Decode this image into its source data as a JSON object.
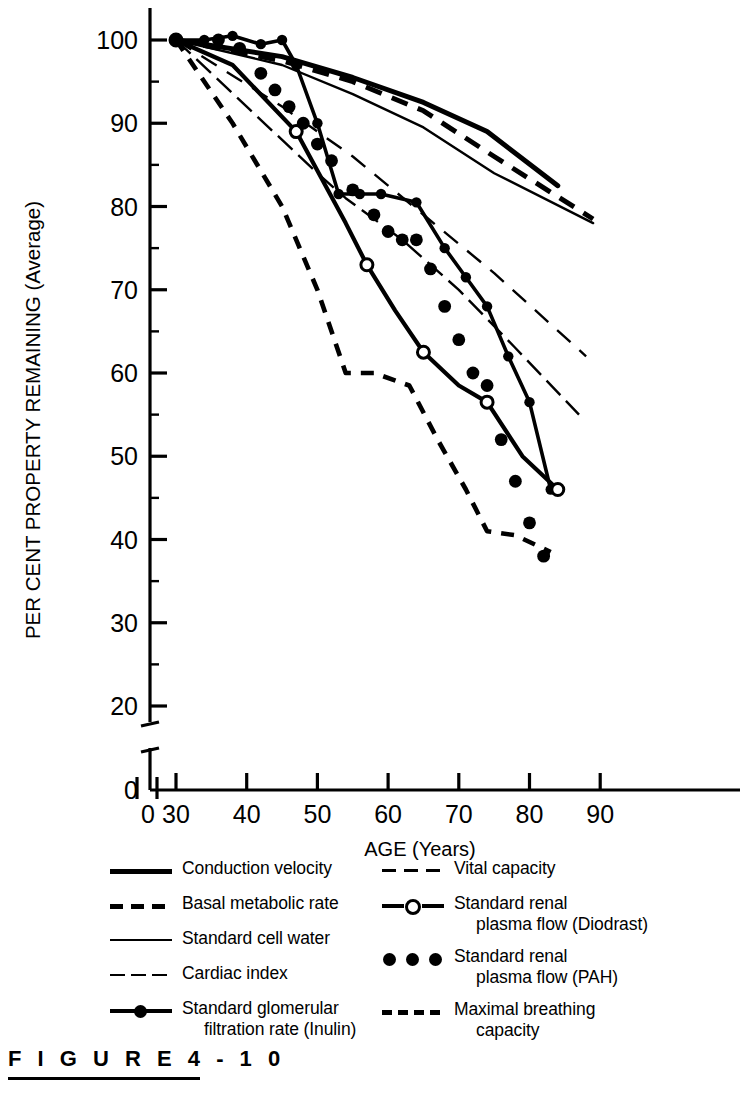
{
  "figure": {
    "caption": "F I G U R E   4 - 1 0",
    "number": "4-10"
  },
  "axes": {
    "x_label": "AGE (Years)",
    "y_label": "PER CENT PROPERTY REMAINING (Average)",
    "x_ticks": [
      "0",
      "30",
      "40",
      "50",
      "60",
      "70",
      "80",
      "90"
    ],
    "y_ticks": [
      "0",
      "20",
      "30",
      "40",
      "50",
      "60",
      "70",
      "80",
      "90",
      "100"
    ],
    "x_break": true,
    "y_break": true
  },
  "legend": {
    "left": [
      {
        "label": "Conduction velocity",
        "style": "solid-thick",
        "name": "conduction-velocity"
      },
      {
        "label": "Basal metabolic rate",
        "style": "dashed-thick",
        "name": "basal-metabolic-rate"
      },
      {
        "label": "Standard cell water",
        "style": "solid-thin",
        "name": "standard-cell-water"
      },
      {
        "label": "Cardiac index",
        "style": "dash-dot",
        "name": "cardiac-index"
      },
      {
        "label": "Standard glomerular",
        "label2": "filtration rate (Inulin)",
        "style": "solid-marker-filled",
        "name": "gfr-inulin"
      }
    ],
    "right": [
      {
        "label": "Vital capacity",
        "style": "dashed-thin",
        "name": "vital-capacity"
      },
      {
        "label": "Standard renal",
        "label2": "plasma flow (Diodrast)",
        "style": "solid-marker-open",
        "name": "srpf-diodrast"
      },
      {
        "label": "Standard renal",
        "label2": "plasma flow (PAH)",
        "style": "dotted-round",
        "name": "srpf-pah"
      },
      {
        "label": "Maximal breathing",
        "label2": "capacity",
        "style": "dashed-short",
        "name": "maximal-breathing-capacity"
      }
    ]
  },
  "chart_data": {
    "type": "line",
    "title": "",
    "xlabel": "AGE (Years)",
    "ylabel": "PER CENT PROPERTY REMAINING (Average)",
    "xlim": [
      28,
      92
    ],
    "ylim": [
      20,
      103
    ],
    "grid": false,
    "legend_position": "below",
    "series": [
      {
        "name": "Conduction velocity",
        "style": "solid-thick",
        "x": [
          30,
          45,
          55,
          65,
          74,
          84
        ],
        "y": [
          100,
          98,
          95.5,
          92.5,
          89,
          82.5
        ]
      },
      {
        "name": "Basal metabolic rate",
        "style": "dashed-thick",
        "x": [
          30,
          45,
          55,
          65,
          75,
          89
        ],
        "y": [
          100,
          97.5,
          95,
          91.5,
          86,
          78.5
        ]
      },
      {
        "name": "Standard cell water",
        "style": "solid-thin",
        "x": [
          30,
          45,
          55,
          65,
          75,
          89
        ],
        "y": [
          100,
          97,
          93.5,
          89.5,
          84,
          78
        ]
      },
      {
        "name": "Cardiac index",
        "style": "dash-dot",
        "x": [
          30,
          40,
          50,
          54,
          62,
          70,
          78,
          87
        ],
        "y": [
          100,
          92,
          84,
          81,
          76,
          70,
          63,
          55
        ]
      },
      {
        "name": "Standard glomerular filtration rate (Inulin)",
        "style": "solid-marker-filled",
        "x": [
          30,
          34,
          38,
          42,
          45,
          47,
          50,
          53,
          56,
          59,
          64,
          68,
          71,
          74,
          77,
          80,
          83
        ],
        "y": [
          100,
          100,
          100.5,
          99.5,
          100,
          97,
          90,
          81.5,
          81.5,
          81.5,
          80.5,
          75,
          71.5,
          68,
          62,
          56.5,
          46
        ]
      },
      {
        "name": "Vital capacity",
        "style": "dashed-thin",
        "x": [
          30,
          45,
          55,
          65,
          75,
          88
        ],
        "y": [
          100,
          92,
          86,
          79,
          72,
          62
        ]
      },
      {
        "name": "Standard renal plasma flow (Diodrast)",
        "style": "solid-marker-open",
        "x": [
          30,
          38,
          47,
          54,
          57,
          61,
          65,
          70,
          74,
          79,
          84
        ],
        "y": [
          100,
          97,
          89,
          78,
          73,
          67.5,
          62.5,
          58.5,
          56.5,
          50,
          46
        ]
      },
      {
        "name": "Standard renal plasma flow (PAH)",
        "style": "dotted-round",
        "x": [
          30,
          36,
          39,
          42,
          44,
          46,
          48,
          50,
          52,
          55,
          58,
          60,
          62,
          64,
          66,
          68,
          70,
          72,
          74,
          76,
          78,
          80,
          82
        ],
        "y": [
          100,
          100,
          99,
          96,
          94,
          92,
          90,
          87.5,
          85.5,
          82,
          79,
          77,
          76,
          76,
          72.5,
          68,
          64,
          60,
          58.5,
          52,
          47,
          42,
          38
        ]
      },
      {
        "name": "Maximal breathing capacity",
        "style": "dashed-short",
        "x": [
          30,
          38,
          45,
          50,
          54,
          58,
          63,
          67,
          71,
          74,
          78,
          83
        ],
        "y": [
          100,
          90,
          80,
          70,
          60,
          60,
          58.5,
          52,
          46,
          41,
          40.5,
          38.5
        ]
      }
    ]
  }
}
